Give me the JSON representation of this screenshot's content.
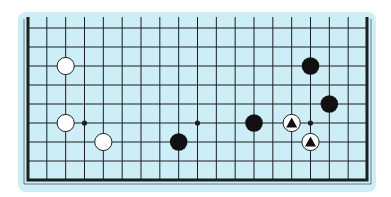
{
  "diagram": {
    "type": "go-board-partial",
    "board_size": 19,
    "visible_rows": 9,
    "colors": {
      "background": "#ffffff",
      "panel": "#cdeef6",
      "line": "#1a1f22",
      "black_stone": "#111111",
      "white_stone": "#ffffff"
    },
    "star_points": [
      {
        "col": 4,
        "row": 4
      },
      {
        "col": 10,
        "row": 4
      },
      {
        "col": 16,
        "row": 4
      }
    ],
    "stones": [
      {
        "color": "white",
        "col": 3,
        "row": 7,
        "mark": ""
      },
      {
        "color": "white",
        "col": 3,
        "row": 4,
        "mark": ""
      },
      {
        "color": "white",
        "col": 5,
        "row": 3,
        "mark": ""
      },
      {
        "color": "black",
        "col": 9,
        "row": 3,
        "mark": ""
      },
      {
        "color": "black",
        "col": 13,
        "row": 4,
        "mark": ""
      },
      {
        "color": "white",
        "col": 15,
        "row": 4,
        "mark": "triangle"
      },
      {
        "color": "white",
        "col": 16,
        "row": 3,
        "mark": "triangle"
      },
      {
        "color": "black",
        "col": 17,
        "row": 5,
        "mark": ""
      },
      {
        "color": "black",
        "col": 16,
        "row": 7,
        "mark": ""
      }
    ]
  }
}
